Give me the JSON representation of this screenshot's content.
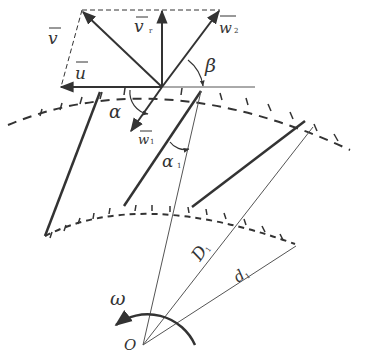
{
  "figure": {
    "type": "velocity triangle diagram of impeller blades",
    "colors": {
      "stroke": "#333333",
      "thin": "#555555",
      "background": "#ffffff"
    }
  },
  "labels": {
    "v": {
      "main": "v",
      "sub": ""
    },
    "vr": {
      "main": "v",
      "sub": "r"
    },
    "w2": {
      "main": "w",
      "sub": "2"
    },
    "u": {
      "main": "u",
      "sub": ""
    },
    "beta": {
      "main": "β"
    },
    "alpha_top": {
      "main": "α"
    },
    "w1": {
      "main": "w",
      "sub": "1"
    },
    "alpha1": {
      "main": "α",
      "sub": "1"
    },
    "D1": {
      "main": "D",
      "sub": "1"
    },
    "d1": {
      "main": "d",
      "sub": "1"
    },
    "omega": {
      "main": "ω"
    },
    "origin": {
      "main": "O"
    }
  }
}
